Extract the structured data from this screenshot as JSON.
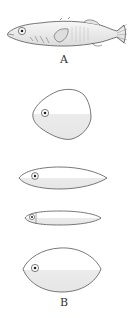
{
  "figure": {
    "labels": {
      "a": "A",
      "b": "B"
    },
    "colors": {
      "outline": "#555555",
      "fill": "#ffffff",
      "shade": "#ececec",
      "eye": "#222222"
    },
    "panel_a": {
      "subject": "stickleback-fish-drawing"
    },
    "panel_b": {
      "shapes": [
        {
          "name": "deep-rhomboid-body"
        },
        {
          "name": "fusiform-body"
        },
        {
          "name": "slender-elongate-body"
        },
        {
          "name": "lens-shaped-body"
        }
      ]
    }
  }
}
